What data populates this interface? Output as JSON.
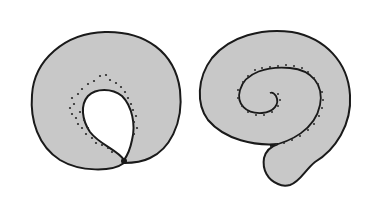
{
  "figure": {
    "colors": {
      "fill": "#c8c8c8",
      "outline": "#1a1a1a",
      "hole": "#ffffff",
      "dots": "#2a2a2a",
      "background": "#ffffff"
    },
    "panels": [
      {
        "id": "left",
        "shape": "closed-ring-with-teardrop-opening"
      },
      {
        "id": "right",
        "shape": "spiral-coil"
      }
    ]
  }
}
